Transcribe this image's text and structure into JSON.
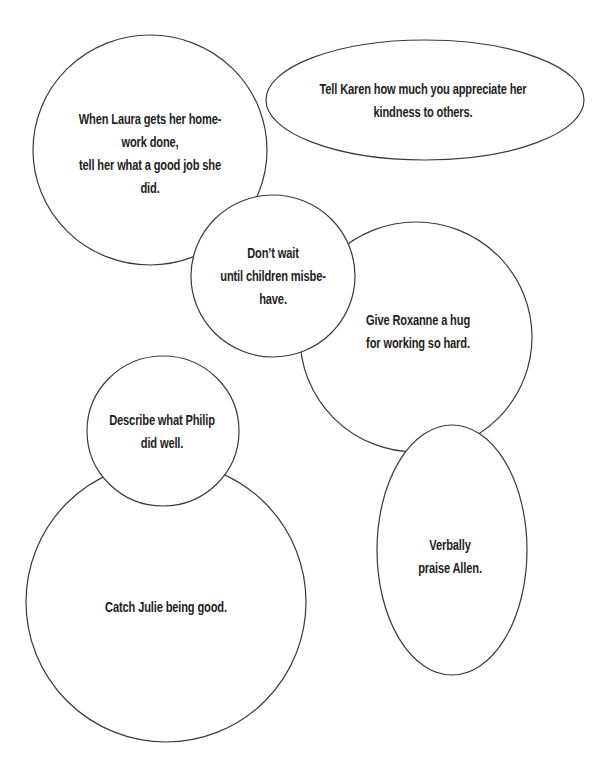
{
  "diagram": {
    "stroke_color": "#3a3a3a",
    "text_color": "#1e1e1e",
    "background": "#ffffff",
    "bubbles": [
      {
        "id": "laura",
        "shape": "circle",
        "cx": 150,
        "cy": 150,
        "rx": 117,
        "ry": 115,
        "text_top": 107,
        "lines": [
          "When Laura gets her home-",
          "work done,",
          "tell her what a good job she",
          "did."
        ]
      },
      {
        "id": "karen",
        "shape": "ellipse",
        "cx": 425,
        "cy": 100,
        "rx": 159,
        "ry": 60,
        "text_top": 77,
        "lines": [
          "Tell Karen how much you appreciate her",
          "kindness to others."
        ]
      },
      {
        "id": "roxanne",
        "shape": "circle",
        "cx": 416,
        "cy": 337,
        "rx": 116,
        "ry": 115,
        "text_top": 308,
        "lines": [
          "Give Roxanne a hug",
          "for working so hard."
        ]
      },
      {
        "id": "dont-wait",
        "shape": "circle",
        "cx": 273,
        "cy": 276,
        "rx": 82,
        "ry": 81,
        "text_top": 241,
        "lines": [
          "Don’t wait",
          "until children misbe-",
          "have."
        ]
      },
      {
        "id": "allen",
        "shape": "ellipse",
        "cx": 452,
        "cy": 550,
        "rx": 75,
        "ry": 125,
        "text_top": 533,
        "lines": [
          "Verbally",
          "praise Allen."
        ]
      },
      {
        "id": "julie",
        "shape": "circle",
        "cx": 166,
        "cy": 602,
        "rx": 140,
        "ry": 140,
        "text_top": 595,
        "lines": [
          "Catch Julie being good."
        ]
      },
      {
        "id": "philip",
        "shape": "circle",
        "cx": 163,
        "cy": 431,
        "rx": 76,
        "ry": 75,
        "text_top": 408,
        "lines": [
          "Describe what Philip",
          "did well."
        ]
      }
    ]
  }
}
